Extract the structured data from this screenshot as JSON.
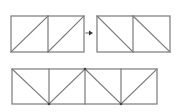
{
  "diagram": {
    "title": "",
    "stroke_color": "#7a7a7a",
    "joint_color": "#444444",
    "background": "#ffffff",
    "panels_top_left": {
      "box": {
        "x": 11,
        "y": 16,
        "w": 73,
        "h": 36
      },
      "dividers_x": [
        48
      ],
      "diagonals": [
        {
          "x1": 11,
          "y1": 52,
          "x2": 48,
          "y2": 16
        },
        {
          "x1": 48,
          "y1": 52,
          "x2": 84,
          "y2": 16
        }
      ]
    },
    "arrow": {
      "x1": 86,
      "y1": 33,
      "x2": 93,
      "y2": 33,
      "direction": "right"
    },
    "panels_top_right": {
      "box": {
        "x": 97,
        "y": 16,
        "w": 73,
        "h": 36
      },
      "dividers_x": [
        133
      ],
      "diagonals": [
        {
          "x1": 97,
          "y1": 16,
          "x2": 133,
          "y2": 52
        },
        {
          "x1": 133,
          "y1": 16,
          "x2": 170,
          "y2": 52
        }
      ]
    },
    "truss_bottom": {
      "box": {
        "x": 12,
        "y": 69,
        "w": 145,
        "h": 35
      },
      "verticals_x": [
        49,
        85,
        121
      ],
      "diagonals": [
        {
          "x1": 12,
          "y1": 69,
          "x2": 49,
          "y2": 104
        },
        {
          "x1": 49,
          "y1": 104,
          "x2": 85,
          "y2": 69
        },
        {
          "x1": 85,
          "y1": 69,
          "x2": 121,
          "y2": 104
        },
        {
          "x1": 121,
          "y1": 104,
          "x2": 157,
          "y2": 69
        }
      ],
      "joints": [
        {
          "x": 49,
          "y": 104
        },
        {
          "x": 85,
          "y": 69
        },
        {
          "x": 121,
          "y": 104
        }
      ]
    }
  }
}
